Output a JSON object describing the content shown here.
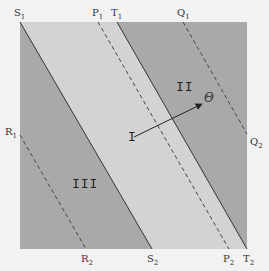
{
  "diagram": {
    "colors": {
      "background": "#f2f2f2",
      "dark_region": "#a9a9a9",
      "light_region": "#d3d3d3",
      "line": "#333333"
    },
    "regions": {
      "I": "I",
      "II": "II",
      "III": "III"
    },
    "arrow_label": "Θ",
    "points": [
      {
        "name": "S",
        "sub": "1"
      },
      {
        "name": "P",
        "sub": "1"
      },
      {
        "name": "T",
        "sub": "1"
      },
      {
        "name": "Q",
        "sub": "1"
      },
      {
        "name": "R",
        "sub": "1"
      },
      {
        "name": "Q",
        "sub": "2"
      },
      {
        "name": "R",
        "sub": "2"
      },
      {
        "name": "S",
        "sub": "2"
      },
      {
        "name": "P",
        "sub": "2"
      },
      {
        "name": "T",
        "sub": "2"
      }
    ]
  }
}
